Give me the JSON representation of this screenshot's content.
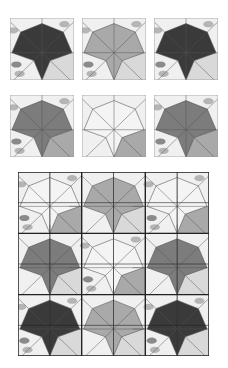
{
  "figure": {
    "colors": {
      "dark": "#3a3a3a",
      "mid": "#7c7c7c",
      "light_mid": "#a9a9a9",
      "pale": "#d9d9d9",
      "white": "#f4f4f4",
      "line": "#555555",
      "frame": "#222222"
    },
    "tiles": [
      {
        "id": "tile-1",
        "star": "dark",
        "lower": "pale",
        "texture": true
      },
      {
        "id": "tile-2",
        "star": "light_mid",
        "lower": "pale",
        "texture": true
      },
      {
        "id": "tile-3",
        "star": "dark",
        "lower": "pale",
        "texture": true
      },
      {
        "id": "tile-4",
        "star": "mid",
        "lower": "light_mid",
        "texture": true
      },
      {
        "id": "tile-5",
        "star": "white",
        "lower": "light_mid",
        "texture": false
      },
      {
        "id": "tile-6",
        "star": "mid",
        "lower": "light_mid",
        "texture": true
      }
    ],
    "grid": {
      "rows": 3,
      "cols": 3,
      "row_stars": [
        [
          "white",
          "light_mid",
          "white"
        ],
        [
          "mid",
          "white",
          "mid"
        ],
        [
          "dark",
          "light_mid",
          "dark"
        ]
      ]
    }
  }
}
